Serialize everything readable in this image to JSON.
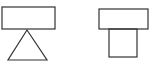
{
  "figure": {
    "stroke_color": "#333333",
    "background": "#ffffff",
    "shapes": [
      {
        "id": "left-rectangle",
        "type": "rect",
        "x": 2,
        "y": 7,
        "w": 53,
        "h": 22
      },
      {
        "id": "left-triangle",
        "type": "triangle",
        "points": "27,30 8,60 47,60"
      },
      {
        "id": "right-rectangle",
        "type": "rect",
        "x": 99,
        "y": 9,
        "w": 49,
        "h": 20
      },
      {
        "id": "right-square",
        "type": "rect",
        "x": 109,
        "y": 29,
        "w": 28,
        "h": 28
      }
    ]
  }
}
